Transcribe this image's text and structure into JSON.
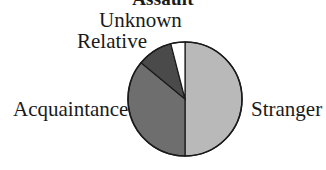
{
  "chart_data": {
    "type": "pie",
    "title": "Assault",
    "categories": [
      "Stranger",
      "Acquaintance",
      "Relative",
      "Unknown"
    ],
    "values": [
      50,
      36,
      10,
      4
    ],
    "units": "percent (estimated from slice angles)",
    "colors": [
      "#b9b9b9",
      "#6e6e6e",
      "#4a4a4a",
      "#ffffff"
    ],
    "start_angle": "12 o'clock, clockwise",
    "legend": "none (direct labels)",
    "labels": {
      "unknown": "Unknown",
      "relative": "Relative",
      "acquaintance": "Acquaintance",
      "stranger": "Stranger"
    }
  }
}
